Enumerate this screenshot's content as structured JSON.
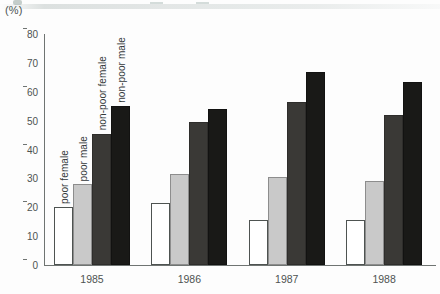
{
  "figure": {
    "unit_label": "(%)"
  },
  "chart_data": {
    "type": "bar",
    "title": "",
    "subtitle": "",
    "xlabel": "",
    "ylabel": "(%)",
    "ylim": [
      0,
      80
    ],
    "yticks": [
      0,
      10,
      20,
      30,
      40,
      50,
      60,
      70,
      80
    ],
    "ytick_labels": [
      "0",
      "10",
      "20",
      "30",
      "40",
      "50",
      "60",
      "70",
      "80"
    ],
    "grid": false,
    "legend_position": "in-plot-rotated-bar-labels",
    "categories": [
      "1985",
      "1986",
      "1987",
      "1988"
    ],
    "series": [
      {
        "name": "poor female",
        "color": "#ffffff",
        "values": [
          20,
          21.5,
          15.5,
          15.5
        ]
      },
      {
        "name": "poor male",
        "color": "#c9c9c9",
        "values": [
          28,
          31.5,
          30.5,
          29
        ]
      },
      {
        "name": "non-poor female",
        "color": "#3a3936",
        "values": [
          45.5,
          49.5,
          56.5,
          52
        ]
      },
      {
        "name": "non-poor male",
        "color": "#191917",
        "values": [
          55,
          54,
          67,
          63.5
        ]
      }
    ],
    "annotations": [
      {
        "text": "poor female",
        "series": 0,
        "group": 0,
        "rotation": 90
      },
      {
        "text": "poor male",
        "series": 1,
        "group": 0,
        "rotation": 90
      },
      {
        "text": "non-poor female",
        "series": 2,
        "group": 0,
        "rotation": 90
      },
      {
        "text": "non-poor male",
        "series": 3,
        "group": 0,
        "rotation": 90
      }
    ]
  }
}
